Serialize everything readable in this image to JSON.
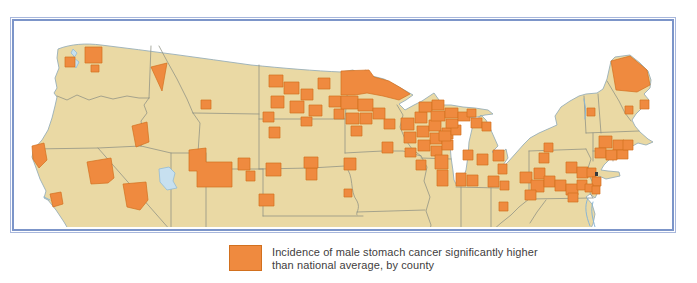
{
  "figure": {
    "type": "choropleth map",
    "legend": {
      "swatch_color": "#EF8A3F",
      "line1": "Incidence of male stomach cancer significantly higher",
      "line2": "than national average, by county"
    },
    "colors": {
      "land": "#EAD9A4",
      "highlight": "#EF8A3F",
      "highlight_border": "#D2701E",
      "state_border": "#8E9184",
      "coastline": "#98AFB8",
      "small_water": "#C7E0F0",
      "frame_blue": "#7C95C9",
      "background": "#FFFFFF",
      "legend_text": "#3F4040"
    },
    "map": {
      "area_shown": "Northern half of the conterminous United States (map clipped by frame at bottom)",
      "highlight_cluster_regions": [
        "Puget Sound area, Washington",
        "Idaho panhandle and southern Idaho",
        "Montana (scattered counties)",
        "Southwest Wyoming / Utah border block",
        "North Dakota (many scattered counties)",
        "Northern and central Minnesota",
        "Wisconsin (dense cluster)",
        "Upper Peninsula of Michigan",
        "Chicago area, Illinois / northwest Indiana",
        "Lower Michigan shoreline counties",
        "Northeast Ohio and western Pennsylvania",
        "Central Pennsylvania / southern New York",
        "New York City metro and New Jersey",
        "Massachusetts, Connecticut and Rhode Island",
        "Northern Maine",
        "Northern California coast, eastern California and Nevada"
      ]
    }
  }
}
